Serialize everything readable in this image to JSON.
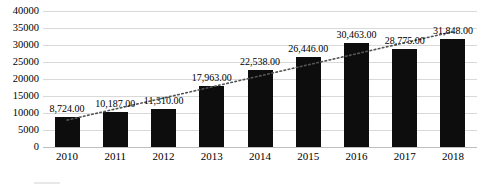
{
  "chart_data": {
    "type": "bar",
    "title": "",
    "xlabel": "",
    "ylabel": "",
    "categories": [
      "2010",
      "2011",
      "2012",
      "2013",
      "2014",
      "2015",
      "2016",
      "2017",
      "2018"
    ],
    "values": [
      8724,
      10187,
      11310,
      17963,
      22538,
      26446,
      30463,
      28775,
      31848
    ],
    "data_labels": [
      "8,724.00",
      "10,187.00",
      "11,310.00",
      "17,963.00",
      "22,538.00",
      "26,446.00",
      "30,463.00",
      "28,775.00",
      "31,848.00"
    ],
    "ylim": [
      0,
      40000
    ],
    "ytick_values": [
      0,
      5000,
      10000,
      15000,
      20000,
      25000,
      30000,
      35000,
      40000
    ],
    "ytick_labels": [
      "0",
      "5000",
      "10000",
      "15000",
      "20000",
      "25000",
      "30000",
      "35000",
      "40000"
    ],
    "grid": true,
    "grid_axis": "y",
    "legend_position": "bottom",
    "bar_color": "#0d0d0d",
    "gridline_color": "#d9d9d9",
    "series": [
      {
        "name": "bars",
        "type": "bar",
        "values": [
          8724,
          10187,
          11310,
          17963,
          22538,
          26446,
          30463,
          28775,
          31848
        ]
      },
      {
        "name": "trendline",
        "type": "line",
        "style": "dotted",
        "color": "#555555",
        "values": [
          8000,
          11000,
          14000,
          17000,
          20000,
          23000,
          26000,
          29000,
          32000
        ]
      }
    ],
    "annotations": {
      "title_cropped": "",
      "legend_cropped": ""
    }
  },
  "legend": {
    "label": ""
  }
}
